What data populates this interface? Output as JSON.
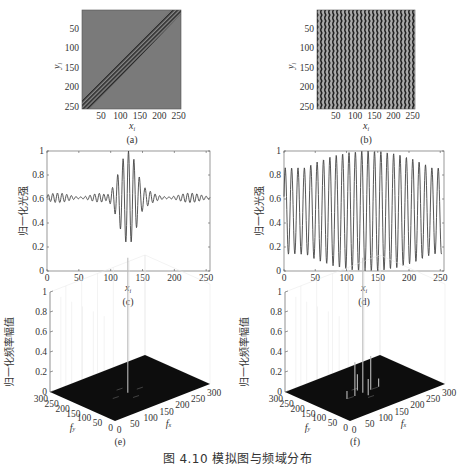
{
  "figure": {
    "caption": "图 4.10   模拟图与频域分布"
  },
  "chart_data": [
    {
      "id": "a",
      "type": "heatmap",
      "panel_label": "(a)",
      "xlabel": "x_i",
      "ylabel": "y_i",
      "xticks": [
        50,
        100,
        150,
        200,
        250
      ],
      "yticks": [
        50,
        100,
        150,
        200,
        250
      ],
      "xlim": [
        1,
        256
      ],
      "ylim": [
        1,
        256
      ],
      "description": "Simulated fringe image: uniform gray field with diagonal high-contrast fringes along the anti-diagonal band (lower-left to upper-right)"
    },
    {
      "id": "b",
      "type": "heatmap",
      "panel_label": "(b)",
      "xlabel": "x_i",
      "ylabel": "y_i",
      "xticks": [
        50,
        100,
        150,
        200,
        250
      ],
      "yticks": [
        50,
        100,
        150,
        200,
        250
      ],
      "xlim": [
        1,
        256
      ],
      "ylim": [
        1,
        256
      ],
      "description": "Simulated fringe image: ~25 near-vertical fringes across full field"
    },
    {
      "id": "c",
      "type": "line",
      "panel_label": "(c)",
      "xlabel": "x_i",
      "ylabel": "归一化光强",
      "xticks": [
        0,
        50,
        100,
        150,
        200,
        250
      ],
      "yticks": [
        0,
        0.2,
        0.4,
        0.6,
        0.8,
        1
      ],
      "xlim": [
        0,
        256
      ],
      "ylim": [
        0,
        1
      ],
      "series": [
        {
          "name": "intensity",
          "baseline": 0.61,
          "envelope_center": 128,
          "envelope_width": 14,
          "peak_max": 1.0,
          "trough_min": 0.14,
          "period": 8.5,
          "side_ripple": 0.04
        }
      ]
    },
    {
      "id": "d",
      "type": "line",
      "panel_label": "(d)",
      "xlabel": "x_i",
      "ylabel": "归一化光强",
      "xticks": [
        0,
        50,
        100,
        150,
        200,
        250
      ],
      "yticks": [
        0,
        0.2,
        0.4,
        0.6,
        0.8,
        1
      ],
      "xlim": [
        0,
        256
      ],
      "ylim": [
        0,
        1
      ],
      "series": [
        {
          "name": "intensity",
          "period": 10.2,
          "center": 135,
          "edge_peak": 0.86,
          "edge_trough": 0.14,
          "center_peak": 1.0,
          "center_trough": 0.0
        }
      ]
    },
    {
      "id": "e",
      "type": "surface3d",
      "panel_label": "(e)",
      "xlabel": "f_x",
      "ylabel": "f_y",
      "zlabel": "归一化频率幅值",
      "xticks": [
        0,
        50,
        100,
        150,
        200,
        250,
        300
      ],
      "yticks": [
        0,
        50,
        100,
        150,
        200,
        250,
        300
      ],
      "zticks": [
        0,
        0.2,
        0.4,
        0.6,
        0.8,
        1
      ],
      "peaks": [
        {
          "fx": 128,
          "fy": 128,
          "z": 1.0
        }
      ]
    },
    {
      "id": "f",
      "type": "surface3d",
      "panel_label": "(f)",
      "xlabel": "f_x",
      "ylabel": "f_y",
      "zlabel": "归一化频率幅值",
      "xticks": [
        0,
        50,
        100,
        150,
        200,
        250,
        300
      ],
      "yticks": [
        0,
        50,
        100,
        150,
        200,
        250,
        300
      ],
      "zticks": [
        0,
        0.2,
        0.4,
        0.6,
        0.8,
        1
      ],
      "peaks": [
        {
          "fx": 128,
          "fy": 128,
          "z": 1.0
        },
        {
          "fx": 153,
          "fy": 128,
          "z": 0.25
        },
        {
          "fx": 103,
          "fy": 128,
          "z": 0.25
        },
        {
          "fx": 128,
          "fy": 153,
          "z": 0.12
        },
        {
          "fx": 128,
          "fy": 103,
          "z": 0.12
        },
        {
          "fx": 178,
          "fy": 128,
          "z": 0.06
        },
        {
          "fx": 78,
          "fy": 128,
          "z": 0.06
        }
      ]
    }
  ]
}
